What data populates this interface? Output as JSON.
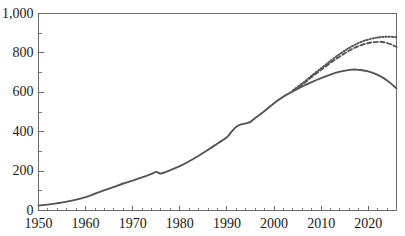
{
  "chart_data": {
    "type": "line",
    "title": "",
    "xlabel": "",
    "ylabel": "",
    "xlim": [
      1950,
      2026
    ],
    "ylim": [
      0,
      1000
    ],
    "grid": false,
    "legend": "none",
    "x_ticks": [
      1950,
      1960,
      1970,
      1980,
      1990,
      2000,
      2010,
      2020
    ],
    "x_tick_labels": [
      "1950",
      "1960",
      "1970",
      "1980",
      "1990",
      "2000",
      "2010",
      "2020"
    ],
    "x_minor_tick_interval": 2,
    "y_ticks": [
      0,
      200,
      400,
      600,
      800,
      1000
    ],
    "y_tick_labels": [
      "0",
      "200",
      "400",
      "600",
      "800",
      "1,000"
    ],
    "y_minor_tick_interval": 100,
    "line_color": "#555555",
    "axis_color": "#6b6b6b",
    "series": [
      {
        "name": "historical-and-projection-low",
        "style": "solid",
        "x": [
          1950,
          1952,
          1954,
          1956,
          1958,
          1960,
          1962,
          1964,
          1966,
          1968,
          1970,
          1972,
          1974,
          1975,
          1976,
          1978,
          1980,
          1982,
          1984,
          1986,
          1988,
          1990,
          1991,
          1992,
          1993,
          1994,
          1995,
          1996,
          1998,
          2000,
          2002,
          2004,
          2006,
          2008,
          2010,
          2012,
          2014,
          2016,
          2017,
          2018,
          2020,
          2022,
          2024,
          2026
        ],
        "values": [
          25,
          30,
          37,
          45,
          55,
          68,
          85,
          103,
          120,
          137,
          152,
          168,
          186,
          196,
          188,
          205,
          225,
          250,
          278,
          308,
          340,
          372,
          400,
          425,
          437,
          442,
          450,
          470,
          505,
          545,
          578,
          605,
          630,
          652,
          672,
          690,
          705,
          714,
          716,
          714,
          706,
          688,
          660,
          620
        ]
      },
      {
        "name": "projection-medium",
        "style": "dashed",
        "x": [
          2004,
          2006,
          2008,
          2010,
          2012,
          2014,
          2016,
          2018,
          2020,
          2022,
          2023,
          2024,
          2025,
          2026
        ],
        "values": [
          608,
          640,
          678,
          714,
          750,
          782,
          812,
          835,
          850,
          856,
          855,
          850,
          842,
          830
        ]
      },
      {
        "name": "projection-high",
        "style": "dotted",
        "x": [
          2004,
          2006,
          2008,
          2010,
          2012,
          2014,
          2016,
          2018,
          2020,
          2022,
          2024,
          2026
        ],
        "values": [
          610,
          645,
          684,
          722,
          760,
          795,
          826,
          851,
          868,
          878,
          882,
          880
        ]
      }
    ]
  }
}
